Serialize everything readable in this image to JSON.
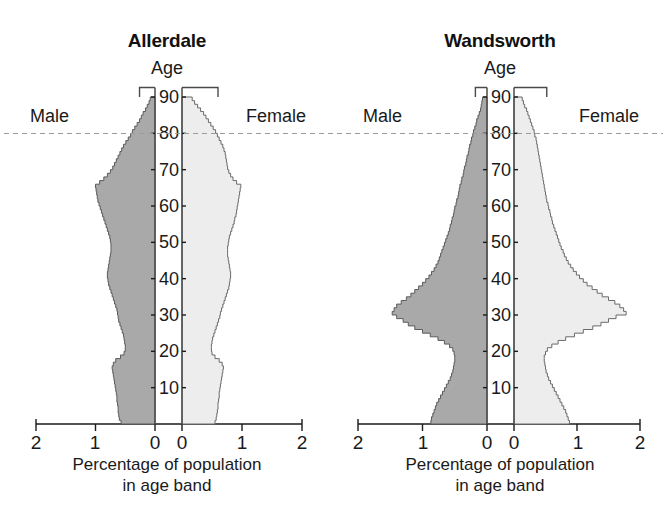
{
  "figure": {
    "background": "#ffffff",
    "male_color": "#a9a9a9",
    "female_color": "#ededed",
    "outline_color": "#5a5a5a",
    "reference_line_color": "#9a9a9a"
  },
  "panels": [
    {
      "key": "allerdale",
      "title": "Allerdale",
      "age_axis_caption": "Age",
      "male_label": "Male",
      "female_label": "Female",
      "x_caption_line1": "Percentage of population",
      "x_caption_line2": "in age band",
      "x_ticks_left": [
        "2",
        "1",
        "0"
      ],
      "x_ticks_right": [
        "0",
        "1",
        "2"
      ],
      "age_ticks": [
        "90",
        "80",
        "70",
        "60",
        "50",
        "40",
        "30",
        "20",
        "10"
      ]
    },
    {
      "key": "wandsworth",
      "title": "Wandsworth",
      "age_axis_caption": "Age",
      "male_label": "Male",
      "female_label": "Female",
      "x_caption_line1": "Percentage of population",
      "x_caption_line2": "in age band",
      "x_ticks_left": [
        "2",
        "1",
        "0"
      ],
      "x_ticks_right": [
        "0",
        "1",
        "2"
      ],
      "age_ticks": [
        "90",
        "80",
        "70",
        "60",
        "50",
        "40",
        "30",
        "20",
        "10"
      ]
    }
  ],
  "chart_data": [
    {
      "type": "area",
      "chart_kind": "population-pyramid",
      "title": "Allerdale",
      "xlabel": "Percentage of population in age band",
      "ylabel": "Age",
      "xlim": [
        0,
        2
      ],
      "ylim": [
        0,
        90
      ],
      "x_ticks": [
        2,
        1,
        0,
        0,
        1,
        2
      ],
      "y_ticks": [
        10,
        20,
        30,
        40,
        50,
        60,
        70,
        80,
        90
      ],
      "grid": false,
      "legend": [
        "Male",
        "Female"
      ],
      "legend_position": "inline-left-right",
      "reference_line_age": 80,
      "ages": [
        0,
        1,
        2,
        3,
        4,
        5,
        6,
        7,
        8,
        9,
        10,
        11,
        12,
        13,
        14,
        15,
        16,
        17,
        18,
        19,
        20,
        21,
        22,
        23,
        24,
        25,
        26,
        27,
        28,
        29,
        30,
        31,
        32,
        33,
        34,
        35,
        36,
        37,
        38,
        39,
        40,
        41,
        42,
        43,
        44,
        45,
        46,
        47,
        48,
        49,
        50,
        51,
        52,
        53,
        54,
        55,
        56,
        57,
        58,
        59,
        60,
        61,
        62,
        63,
        64,
        65,
        66,
        67,
        68,
        69,
        70,
        71,
        72,
        73,
        74,
        75,
        76,
        77,
        78,
        79,
        80,
        81,
        82,
        83,
        84,
        85,
        86,
        87,
        88,
        89,
        90
      ],
      "series": [
        {
          "name": "Male",
          "side": "left",
          "values": [
            0.57,
            0.6,
            0.61,
            0.62,
            0.62,
            0.63,
            0.64,
            0.64,
            0.65,
            0.66,
            0.67,
            0.68,
            0.69,
            0.7,
            0.71,
            0.72,
            0.7,
            0.66,
            0.58,
            0.52,
            0.5,
            0.5,
            0.51,
            0.52,
            0.53,
            0.55,
            0.57,
            0.59,
            0.61,
            0.62,
            0.63,
            0.64,
            0.66,
            0.68,
            0.7,
            0.72,
            0.74,
            0.76,
            0.78,
            0.79,
            0.8,
            0.8,
            0.79,
            0.78,
            0.77,
            0.76,
            0.75,
            0.74,
            0.74,
            0.74,
            0.75,
            0.76,
            0.78,
            0.8,
            0.82,
            0.84,
            0.86,
            0.88,
            0.9,
            0.92,
            0.94,
            0.96,
            0.97,
            0.98,
            0.99,
            1.0,
            0.93,
            0.86,
            0.8,
            0.75,
            0.71,
            0.68,
            0.65,
            0.62,
            0.59,
            0.56,
            0.53,
            0.49,
            0.45,
            0.41,
            0.38,
            0.34,
            0.3,
            0.26,
            0.23,
            0.2,
            0.16,
            0.13,
            0.1,
            0.08,
            0.26
          ]
        },
        {
          "name": "Female",
          "side": "right",
          "values": [
            0.55,
            0.57,
            0.58,
            0.59,
            0.6,
            0.6,
            0.61,
            0.62,
            0.62,
            0.63,
            0.64,
            0.65,
            0.66,
            0.67,
            0.68,
            0.69,
            0.67,
            0.62,
            0.55,
            0.5,
            0.49,
            0.49,
            0.5,
            0.51,
            0.53,
            0.55,
            0.57,
            0.59,
            0.61,
            0.63,
            0.64,
            0.66,
            0.68,
            0.7,
            0.72,
            0.74,
            0.76,
            0.78,
            0.79,
            0.8,
            0.81,
            0.81,
            0.8,
            0.79,
            0.78,
            0.77,
            0.76,
            0.76,
            0.76,
            0.77,
            0.78,
            0.79,
            0.81,
            0.83,
            0.85,
            0.87,
            0.88,
            0.9,
            0.91,
            0.92,
            0.93,
            0.94,
            0.95,
            0.96,
            0.97,
            0.98,
            0.91,
            0.85,
            0.81,
            0.78,
            0.76,
            0.75,
            0.74,
            0.73,
            0.72,
            0.7,
            0.68,
            0.65,
            0.62,
            0.59,
            0.56,
            0.52,
            0.48,
            0.44,
            0.4,
            0.36,
            0.31,
            0.26,
            0.21,
            0.17,
            0.6
          ]
        }
      ]
    },
    {
      "type": "area",
      "chart_kind": "population-pyramid",
      "title": "Wandsworth",
      "xlabel": "Percentage of population in age band",
      "ylabel": "Age",
      "xlim": [
        0,
        2
      ],
      "ylim": [
        0,
        90
      ],
      "x_ticks": [
        2,
        1,
        0,
        0,
        1,
        2
      ],
      "y_ticks": [
        10,
        20,
        30,
        40,
        50,
        60,
        70,
        80,
        90
      ],
      "grid": false,
      "legend": [
        "Male",
        "Female"
      ],
      "legend_position": "inline-left-right",
      "reference_line_age": 80,
      "ages": [
        0,
        1,
        2,
        3,
        4,
        5,
        6,
        7,
        8,
        9,
        10,
        11,
        12,
        13,
        14,
        15,
        16,
        17,
        18,
        19,
        20,
        21,
        22,
        23,
        24,
        25,
        26,
        27,
        28,
        29,
        30,
        31,
        32,
        33,
        34,
        35,
        36,
        37,
        38,
        39,
        40,
        41,
        42,
        43,
        44,
        45,
        46,
        47,
        48,
        49,
        50,
        51,
        52,
        53,
        54,
        55,
        56,
        57,
        58,
        59,
        60,
        61,
        62,
        63,
        64,
        65,
        66,
        67,
        68,
        69,
        70,
        71,
        72,
        73,
        74,
        75,
        76,
        77,
        78,
        79,
        80,
        81,
        82,
        83,
        84,
        85,
        86,
        87,
        88,
        89,
        90
      ],
      "series": [
        {
          "name": "Male",
          "side": "left",
          "values": [
            0.87,
            0.86,
            0.84,
            0.82,
            0.8,
            0.78,
            0.75,
            0.72,
            0.69,
            0.66,
            0.63,
            0.6,
            0.57,
            0.55,
            0.53,
            0.52,
            0.51,
            0.5,
            0.5,
            0.51,
            0.53,
            0.58,
            0.66,
            0.76,
            0.88,
            1.0,
            1.12,
            1.22,
            1.3,
            1.4,
            1.47,
            1.44,
            1.4,
            1.33,
            1.25,
            1.18,
            1.12,
            1.06,
            1.0,
            0.95,
            0.9,
            0.86,
            0.82,
            0.79,
            0.76,
            0.74,
            0.72,
            0.7,
            0.68,
            0.66,
            0.64,
            0.62,
            0.6,
            0.58,
            0.57,
            0.55,
            0.54,
            0.52,
            0.51,
            0.5,
            0.48,
            0.47,
            0.45,
            0.44,
            0.43,
            0.42,
            0.4,
            0.39,
            0.37,
            0.36,
            0.35,
            0.33,
            0.32,
            0.31,
            0.29,
            0.28,
            0.27,
            0.25,
            0.24,
            0.22,
            0.21,
            0.19,
            0.17,
            0.16,
            0.14,
            0.12,
            0.1,
            0.09,
            0.08,
            0.07,
            0.18
          ]
        },
        {
          "name": "Female",
          "side": "right",
          "values": [
            0.88,
            0.86,
            0.84,
            0.82,
            0.79,
            0.76,
            0.73,
            0.7,
            0.67,
            0.64,
            0.61,
            0.58,
            0.55,
            0.53,
            0.51,
            0.5,
            0.49,
            0.48,
            0.48,
            0.5,
            0.53,
            0.6,
            0.7,
            0.82,
            0.96,
            1.1,
            1.25,
            1.38,
            1.5,
            1.62,
            1.78,
            1.74,
            1.68,
            1.6,
            1.5,
            1.4,
            1.32,
            1.24,
            1.16,
            1.1,
            1.04,
            0.99,
            0.94,
            0.9,
            0.86,
            0.83,
            0.8,
            0.78,
            0.75,
            0.73,
            0.71,
            0.69,
            0.67,
            0.65,
            0.63,
            0.61,
            0.6,
            0.58,
            0.57,
            0.55,
            0.54,
            0.52,
            0.51,
            0.5,
            0.49,
            0.48,
            0.47,
            0.46,
            0.45,
            0.44,
            0.43,
            0.42,
            0.41,
            0.4,
            0.39,
            0.38,
            0.37,
            0.36,
            0.35,
            0.33,
            0.32,
            0.3,
            0.28,
            0.26,
            0.24,
            0.22,
            0.2,
            0.17,
            0.15,
            0.13,
            0.52
          ]
        }
      ]
    }
  ]
}
